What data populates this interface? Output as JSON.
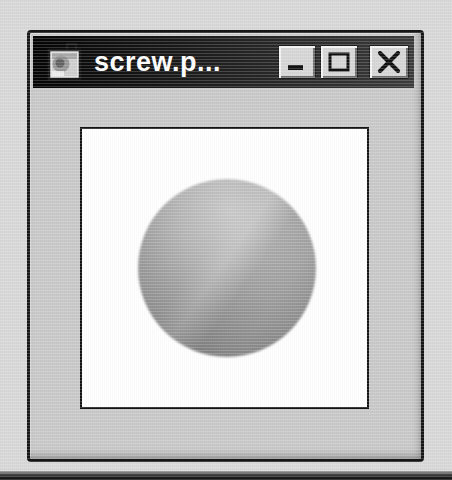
{
  "window": {
    "title": "screw.p...",
    "titlebar": {
      "icon": "image-file-icon",
      "buttons": [
        {
          "name": "minimize",
          "glyph": "_"
        },
        {
          "name": "maximize",
          "glyph": "□"
        },
        {
          "name": "close",
          "glyph": "✕"
        }
      ]
    },
    "content": {
      "type": "image-canvas",
      "image_description": "gray shaded sphere on white background"
    }
  },
  "colors": {
    "page_bg": "#d8d8d8",
    "window_face": "#c9c9c9",
    "window_border": "#161616",
    "titlebar_left": "#050505",
    "titlebar_right": "#3c3c3c",
    "title_text": "#ffffff",
    "button_face": "#d6d6d6",
    "canvas_bg": "#ffffff",
    "canvas_border": "#141414",
    "sphere_light": "#c9c9c9",
    "sphere_dark": "#7d7d7d",
    "bottom_band": "#1f1f1f"
  }
}
